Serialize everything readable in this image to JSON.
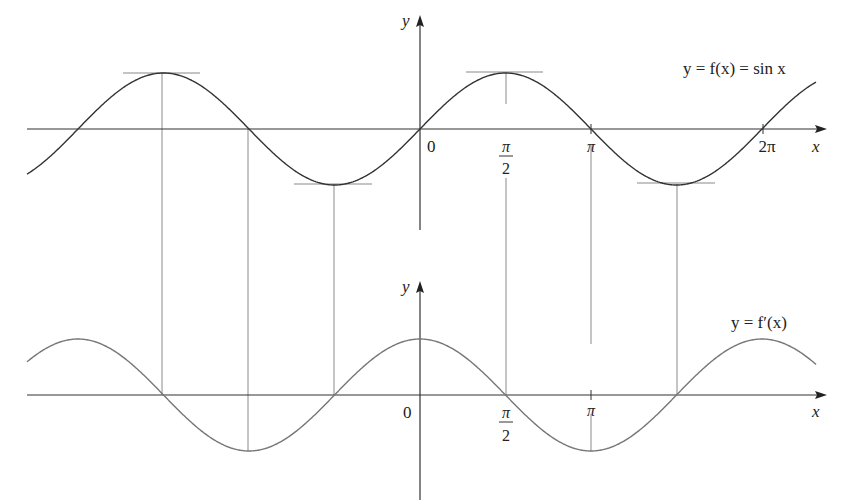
{
  "chart_data": [
    {
      "type": "line",
      "title": "",
      "function_label": "y = f(x) = sin x",
      "xlabel": "x",
      "ylabel": "y",
      "x_ticks": [
        {
          "value": 0,
          "label": "0"
        },
        {
          "value": 1.5708,
          "label": "π/2",
          "num": "π",
          "den": "2"
        },
        {
          "value": 3.1416,
          "label": "π"
        },
        {
          "value": 6.2832,
          "label": "2π"
        }
      ],
      "x_range": [
        -7.0,
        2.3
      ],
      "y_range": [
        -1,
        1
      ],
      "series": [
        {
          "name": "f(x) = sin x",
          "expr": "sin(x)",
          "color": "#333333"
        }
      ],
      "horizontal_tangents_at": [
        -4.7124,
        -1.5708,
        1.5708,
        4.7124
      ],
      "grid": false
    },
    {
      "type": "line",
      "title": "",
      "function_label": "y = f′(x)",
      "xlabel": "x",
      "ylabel": "y",
      "x_ticks": [
        {
          "value": 0,
          "label": "0"
        },
        {
          "value": 1.5708,
          "label": "π/2",
          "num": "π",
          "den": "2"
        },
        {
          "value": 3.1416,
          "label": "π"
        }
      ],
      "x_range": [
        -7.0,
        2.3
      ],
      "y_range": [
        -1,
        1
      ],
      "series": [
        {
          "name": "f′(x) = cos x",
          "expr": "cos(x)",
          "color": "#777777"
        }
      ],
      "grid": false
    }
  ],
  "top": {
    "y_axis_label": "y",
    "x_axis_label": "x",
    "curve_label": "y = f(x) = sin x",
    "tick_zero": "0",
    "tick_pi_half_num": "π",
    "tick_pi_half_den": "2",
    "tick_pi": "π",
    "tick_two_pi": "2π"
  },
  "bottom": {
    "y_axis_label": "y",
    "x_axis_label": "x",
    "curve_label": "y = f′(x)",
    "tick_zero": "0",
    "tick_pi_half_num": "π",
    "tick_pi_half_den": "2",
    "tick_pi": "π"
  },
  "colors": {
    "axis": "#333333",
    "sin_curve": "#333333",
    "cos_curve": "#808080",
    "guide_lines": "#8a8a8a",
    "tangent_lines": "#8a8a8a"
  }
}
